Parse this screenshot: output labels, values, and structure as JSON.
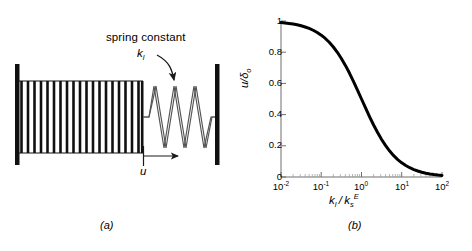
{
  "figure": {
    "panel_a": {
      "caption": "(a)",
      "annotation_label": "spring constant",
      "spring_constant_symbol": "k",
      "spring_constant_subscript": "l",
      "displacement_symbol": "u",
      "elements": {
        "left_wall": "fixed-wall",
        "right_wall": "fixed-wall",
        "stiff_spring": "coil-spring-dense",
        "soft_spring": "coil-spring-sparse",
        "displacement_arrow": "arrow-right"
      }
    },
    "panel_b": {
      "caption": "(b)"
    }
  },
  "chart_data": {
    "type": "line",
    "title": "",
    "xlabel": "k_l / k_s^E",
    "xlabel_parts": {
      "num_base": "k",
      "num_sub": "l",
      "den_base": "k",
      "den_sub": "s",
      "den_sup": "E"
    },
    "ylabel": "u/δ₀",
    "ylabel_parts": {
      "base": "u/δ",
      "sub": "o"
    },
    "xscale": "log",
    "yscale": "linear",
    "xlim": [
      0.01,
      100
    ],
    "ylim": [
      0,
      1
    ],
    "grid": false,
    "legend": null,
    "xticks": [
      {
        "value": 0.01,
        "label": "10",
        "exp": "-2"
      },
      {
        "value": 0.1,
        "label": "10",
        "exp": "-1"
      },
      {
        "value": 1,
        "label": "10",
        "exp": "0"
      },
      {
        "value": 10,
        "label": "10",
        "exp": "1"
      },
      {
        "value": 100,
        "label": "10",
        "exp": "2"
      }
    ],
    "yticks": [
      {
        "value": 0,
        "label": "0"
      },
      {
        "value": 0.2,
        "label": "0.2"
      },
      {
        "value": 0.4,
        "label": "0.4"
      },
      {
        "value": 0.6,
        "label": "0.6"
      },
      {
        "value": 0.8,
        "label": "0.8"
      },
      {
        "value": 1,
        "label": "1"
      }
    ],
    "series": [
      {
        "name": "u/δ₀ = 1/(1 + k_l/k_s^E)",
        "color": "#000000",
        "linewidth": 3,
        "x": [
          0.01,
          0.0126,
          0.0158,
          0.02,
          0.0251,
          0.0316,
          0.0398,
          0.0501,
          0.0631,
          0.0794,
          0.1,
          0.126,
          0.158,
          0.2,
          0.251,
          0.316,
          0.398,
          0.501,
          0.631,
          0.794,
          1.0,
          1.26,
          1.58,
          2.0,
          2.51,
          3.16,
          3.98,
          5.01,
          6.31,
          7.94,
          10.0,
          12.6,
          15.8,
          20.0,
          25.1,
          31.6,
          39.8,
          50.1,
          63.1,
          79.4,
          100.0
        ],
        "y": [
          0.99,
          0.9875,
          0.9844,
          0.9804,
          0.9755,
          0.9694,
          0.9617,
          0.9523,
          0.9407,
          0.9264,
          0.9091,
          0.8881,
          0.8636,
          0.8333,
          0.7994,
          0.7599,
          0.7153,
          0.6662,
          0.6131,
          0.5574,
          0.5,
          0.4425,
          0.3876,
          0.3333,
          0.2849,
          0.2404,
          0.2008,
          0.1664,
          0.1368,
          0.1118,
          0.0909,
          0.0735,
          0.0595,
          0.0476,
          0.0383,
          0.0307,
          0.0245,
          0.0196,
          0.0156,
          0.0124,
          0.0099
        ]
      }
    ]
  }
}
